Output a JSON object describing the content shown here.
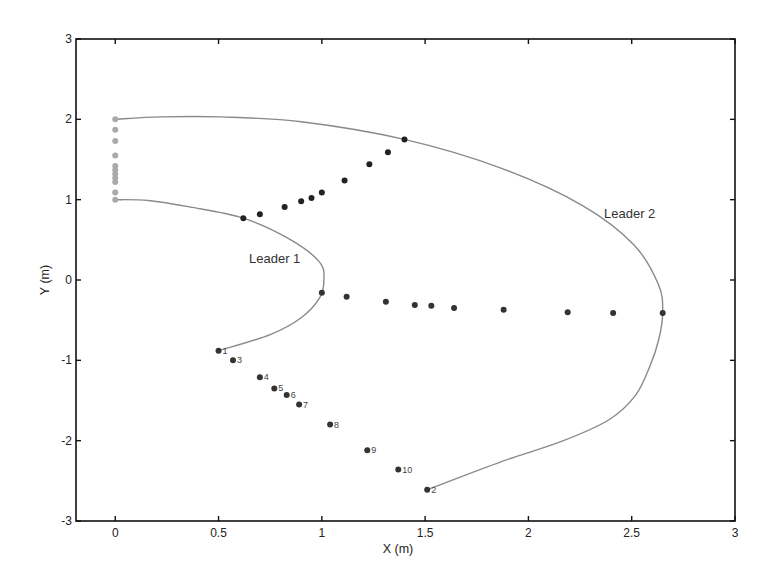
{
  "chart_data": {
    "type": "scatter",
    "title": "",
    "xlabel": "X (m)",
    "ylabel": "Y (m)",
    "xlim": [
      -0.19,
      3
    ],
    "ylim": [
      -3,
      3
    ],
    "xticks": [
      "0",
      "0.5",
      "1",
      "1.5",
      "2",
      "2.5",
      "3"
    ],
    "xtick_values": [
      0,
      0.5,
      1,
      1.5,
      2,
      2.5,
      3
    ],
    "yticks": [
      "-3",
      "-2",
      "-1",
      "0",
      "1",
      "2",
      "3"
    ],
    "ytick_values": [
      -3,
      -2,
      -1,
      0,
      1,
      2,
      3
    ],
    "grid": false,
    "legend": null,
    "annotations": [
      {
        "text": "Leader 1",
        "x": 0.67,
        "y": 0.23
      },
      {
        "text": "Leader 2",
        "x": 2.38,
        "y": 0.83
      }
    ],
    "series": [
      {
        "name": "Leader 1 trajectory",
        "kind": "line",
        "color": "#8a8a8a",
        "points": [
          [
            0.0,
            1.0
          ],
          [
            0.16,
            0.99
          ],
          [
            0.36,
            0.91
          ],
          [
            0.62,
            0.77
          ],
          [
            0.85,
            0.5
          ],
          [
            0.99,
            0.22
          ],
          [
            1.01,
            0.0
          ],
          [
            0.99,
            -0.22
          ],
          [
            0.9,
            -0.47
          ],
          [
            0.75,
            -0.68
          ],
          [
            0.5,
            -0.88
          ]
        ]
      },
      {
        "name": "Leader 2 trajectory",
        "kind": "line",
        "color": "#8a8a8a",
        "points": [
          [
            0.0,
            2.0
          ],
          [
            0.22,
            2.03
          ],
          [
            0.51,
            2.03
          ],
          [
            0.9,
            1.97
          ],
          [
            1.4,
            1.75
          ],
          [
            1.87,
            1.39
          ],
          [
            2.26,
            0.93
          ],
          [
            2.51,
            0.44
          ],
          [
            2.63,
            -0.06
          ],
          [
            2.65,
            -0.41
          ],
          [
            2.63,
            -0.75
          ],
          [
            2.59,
            -1.06
          ],
          [
            2.52,
            -1.43
          ],
          [
            2.39,
            -1.74
          ],
          [
            2.16,
            -2.01
          ],
          [
            1.87,
            -2.26
          ],
          [
            1.51,
            -2.61
          ]
        ]
      },
      {
        "name": "Initial positions",
        "kind": "scatter",
        "color": "#aaaaaa",
        "points": [
          [
            0,
            2.0
          ],
          [
            0,
            1.87
          ],
          [
            0,
            1.73
          ],
          [
            0,
            1.55
          ],
          [
            0,
            1.42
          ],
          [
            0,
            1.37
          ],
          [
            0,
            1.32
          ],
          [
            0,
            1.27
          ],
          [
            0,
            1.22
          ],
          [
            0,
            1.09
          ],
          [
            0,
            1.0
          ]
        ]
      },
      {
        "name": "Formation (upper line)",
        "kind": "scatter",
        "color": "#222222",
        "points": [
          [
            0.62,
            0.77
          ],
          [
            0.7,
            0.82
          ],
          [
            0.82,
            0.91
          ],
          [
            0.9,
            0.98
          ],
          [
            0.95,
            1.02
          ],
          [
            1.0,
            1.09
          ],
          [
            1.11,
            1.24
          ],
          [
            1.23,
            1.44
          ],
          [
            1.32,
            1.59
          ],
          [
            1.4,
            1.75
          ]
        ]
      },
      {
        "name": "Formation (middle line)",
        "kind": "scatter",
        "color": "#333333",
        "points": [
          [
            1.0,
            -0.16
          ],
          [
            1.12,
            -0.21
          ],
          [
            1.31,
            -0.27
          ],
          [
            1.45,
            -0.31
          ],
          [
            1.53,
            -0.32
          ],
          [
            1.64,
            -0.35
          ],
          [
            1.88,
            -0.37
          ],
          [
            2.19,
            -0.4
          ],
          [
            2.41,
            -0.41
          ],
          [
            2.65,
            -0.41
          ]
        ]
      },
      {
        "name": "Final formation (labeled)",
        "kind": "scatter",
        "color": "#333333",
        "points": [
          {
            "label": "1",
            "x": 0.5,
            "y": -0.88
          },
          {
            "label": "3",
            "x": 0.57,
            "y": -1.0
          },
          {
            "label": "4",
            "x": 0.7,
            "y": -1.21
          },
          {
            "label": "5",
            "x": 0.77,
            "y": -1.35
          },
          {
            "label": "6",
            "x": 0.83,
            "y": -1.43
          },
          {
            "label": "7",
            "x": 0.89,
            "y": -1.55
          },
          {
            "label": "8",
            "x": 1.04,
            "y": -1.8
          },
          {
            "label": "9",
            "x": 1.22,
            "y": -2.12
          },
          {
            "label": "10",
            "x": 1.37,
            "y": -2.36
          },
          {
            "label": "2",
            "x": 1.51,
            "y": -2.61
          }
        ]
      }
    ]
  }
}
